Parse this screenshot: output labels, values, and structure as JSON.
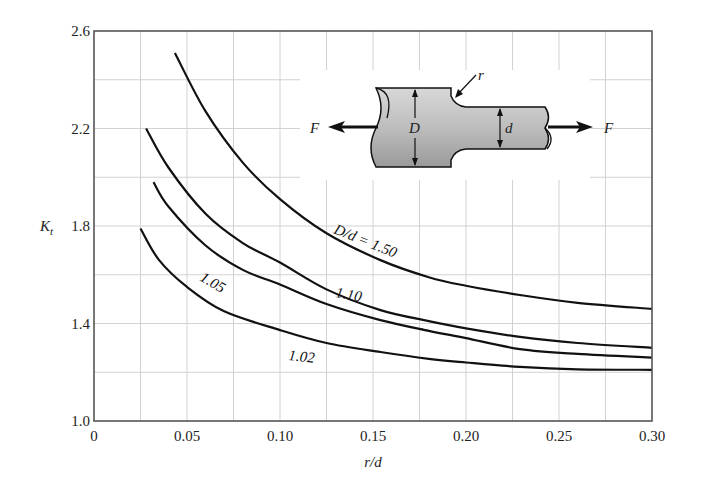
{
  "chart_data": {
    "type": "line",
    "title": "",
    "xlabel": "r/d",
    "ylabel": "K_t",
    "ylabel_main": "K",
    "ylabel_sub": "t",
    "xlim": [
      0,
      0.3
    ],
    "ylim": [
      1.0,
      2.6
    ],
    "x_ticks": [
      0,
      0.05,
      0.1,
      0.15,
      0.2,
      0.25,
      0.3
    ],
    "x_tick_labels": [
      "0",
      "0.05",
      "0.10",
      "0.15",
      "0.20",
      "0.25",
      "0.30"
    ],
    "y_ticks": [
      1.0,
      1.4,
      1.8,
      2.2,
      2.6
    ],
    "y_tick_labels": [
      "1.0",
      "1.4",
      "1.8",
      "2.2",
      "2.6"
    ],
    "grid": true,
    "grid_x_step": 0.025,
    "grid_y_step": 0.2,
    "series": [
      {
        "name": "D/d = 1.50",
        "label": "D/d = 1.50",
        "x": [
          0.0435,
          0.06,
          0.08,
          0.1,
          0.125,
          0.154,
          0.18,
          0.2,
          0.229,
          0.26,
          0.3
        ],
        "y": [
          2.51,
          2.27,
          2.06,
          1.91,
          1.77,
          1.66,
          1.59,
          1.555,
          1.517,
          1.485,
          1.46
        ]
      },
      {
        "name": "D/d = 1.10",
        "label": "1.10",
        "x": [
          0.028,
          0.04,
          0.06,
          0.08,
          0.1,
          0.125,
          0.154,
          0.18,
          0.2,
          0.229,
          0.26,
          0.3
        ],
        "y": [
          2.2,
          2.04,
          1.85,
          1.73,
          1.65,
          1.54,
          1.455,
          1.41,
          1.38,
          1.345,
          1.32,
          1.3
        ]
      },
      {
        "name": "D/d = 1.05",
        "label": "1.05",
        "x": [
          0.032,
          0.04,
          0.06,
          0.08,
          0.1,
          0.125,
          0.154,
          0.18,
          0.2,
          0.229,
          0.26,
          0.3
        ],
        "y": [
          1.98,
          1.88,
          1.72,
          1.62,
          1.56,
          1.48,
          1.414,
          1.37,
          1.34,
          1.295,
          1.275,
          1.26
        ]
      },
      {
        "name": "D/d = 1.02",
        "label": "1.02",
        "x": [
          0.025,
          0.035,
          0.05,
          0.07,
          0.1,
          0.125,
          0.154,
          0.18,
          0.2,
          0.229,
          0.26,
          0.3
        ],
        "y": [
          1.79,
          1.66,
          1.55,
          1.45,
          1.373,
          1.32,
          1.283,
          1.255,
          1.24,
          1.222,
          1.212,
          1.21
        ]
      }
    ],
    "annotations": {
      "inset_diagram": "stepped shaft with fillet radius r under axial load F",
      "force_left": "F",
      "force_right": "F",
      "large_diameter": "D",
      "small_diameter": "d",
      "fillet_radius": "r"
    }
  }
}
